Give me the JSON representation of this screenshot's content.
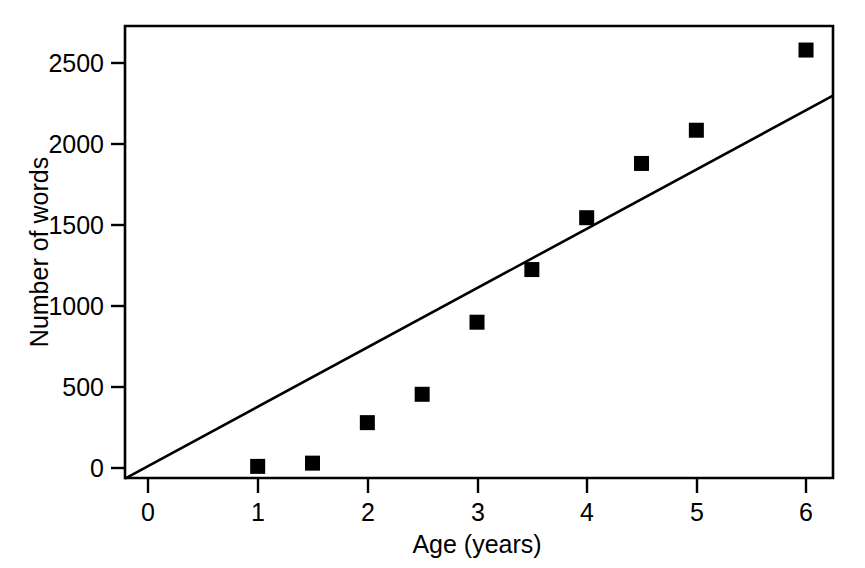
{
  "chart_data": {
    "type": "scatter",
    "title": "",
    "xlabel": "Age (years)",
    "ylabel": "Number of words",
    "xlim": [
      -0.21,
      6.25
    ],
    "ylim": [
      -65,
      2790
    ],
    "grid": false,
    "legend": "none",
    "xticks": [
      0,
      1,
      2,
      3,
      4,
      5,
      6
    ],
    "xtick_labels": [
      "0",
      "1",
      "2",
      "3",
      "4",
      "5",
      "6"
    ],
    "yticks": [
      0,
      500,
      1000,
      1500,
      2000,
      2500
    ],
    "ytick_labels": [
      "0",
      "500",
      "1000",
      "1500",
      "2000",
      "2500"
    ],
    "series": [
      {
        "name": "Vocabulary size",
        "marker": "filled-square",
        "color": "#000000",
        "x": [
          1,
          1.5,
          2,
          2.5,
          3,
          3.5,
          4,
          4.5,
          5,
          6
        ],
        "values": [
          10,
          30,
          280,
          455,
          900,
          1225,
          1545,
          1880,
          2085,
          2580
        ]
      },
      {
        "name": "Linear fit",
        "type": "line",
        "color": "#000000",
        "x": [
          -0.21,
          6.25
        ],
        "values": [
          -65,
          2300
        ]
      }
    ]
  },
  "axes": {
    "y_title": "Number of words",
    "x_title": "Age (years)"
  }
}
